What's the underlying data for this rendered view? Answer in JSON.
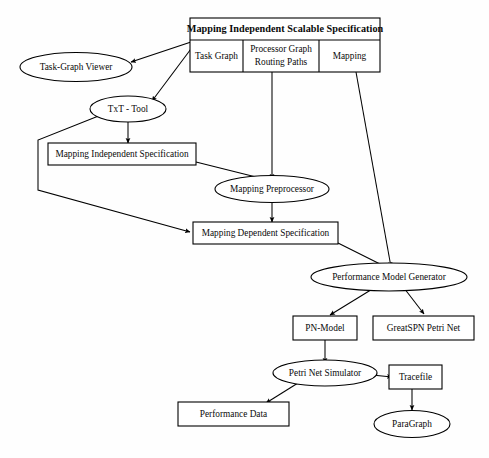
{
  "diagram": {
    "title": "Mapping Independent Scalable Specification",
    "background_color": "#fefefe",
    "line_color": "#000000",
    "spec_box": {
      "header": "Mapping Independent Scalable Specification",
      "cells": [
        {
          "id": "task-graph",
          "label": "Task Graph"
        },
        {
          "id": "processor-graph",
          "label_line1": "Processor Graph",
          "label_line2": "Routing Paths"
        },
        {
          "id": "mapping",
          "label": "Mapping"
        }
      ]
    },
    "nodes": [
      {
        "id": "task-graph-viewer",
        "shape": "ellipse",
        "label": "Task-Graph Viewer"
      },
      {
        "id": "txt-tool",
        "shape": "ellipse",
        "label": "TxT - Tool"
      },
      {
        "id": "mapping-independent-specification",
        "shape": "box",
        "label": "Mapping Independent Specification"
      },
      {
        "id": "mapping-preprocessor",
        "shape": "ellipse",
        "label": "Mapping Preprocessor"
      },
      {
        "id": "mapping-dependent-specification",
        "shape": "box",
        "label": "Mapping Dependent Specification"
      },
      {
        "id": "performance-model-generator",
        "shape": "ellipse",
        "label": "Performance Model Generator"
      },
      {
        "id": "pn-model",
        "shape": "box",
        "label": "PN-Model"
      },
      {
        "id": "greatspn-petri-net",
        "shape": "box",
        "label": "GreatSPN Petri Net"
      },
      {
        "id": "petri-net-simulator",
        "shape": "ellipse",
        "label": "Petri Net Simulator"
      },
      {
        "id": "tracefile",
        "shape": "box",
        "label": "Tracefile"
      },
      {
        "id": "performance-data",
        "shape": "box",
        "label": "Performance Data"
      },
      {
        "id": "paragraph",
        "shape": "ellipse",
        "label": "ParaGraph"
      }
    ],
    "edges": [
      {
        "from": "task-graph",
        "to": "task-graph-viewer"
      },
      {
        "from": "task-graph",
        "to": "txt-tool"
      },
      {
        "from": "txt-tool",
        "to": "mapping-independent-specification"
      },
      {
        "from": "txt-tool",
        "to": "mapping-dependent-specification"
      },
      {
        "from": "processor-graph",
        "to": "mapping-preprocessor"
      },
      {
        "from": "mapping-independent-specification",
        "to": "mapping-preprocessor"
      },
      {
        "from": "mapping-preprocessor",
        "to": "mapping-dependent-specification"
      },
      {
        "from": "mapping",
        "to": "performance-model-generator"
      },
      {
        "from": "mapping-dependent-specification",
        "to": "performance-model-generator"
      },
      {
        "from": "performance-model-generator",
        "to": "pn-model"
      },
      {
        "from": "performance-model-generator",
        "to": "greatspn-petri-net"
      },
      {
        "from": "pn-model",
        "to": "petri-net-simulator"
      },
      {
        "from": "petri-net-simulator",
        "to": "performance-data"
      },
      {
        "from": "petri-net-simulator",
        "to": "tracefile"
      },
      {
        "from": "tracefile",
        "to": "paragraph"
      }
    ]
  }
}
